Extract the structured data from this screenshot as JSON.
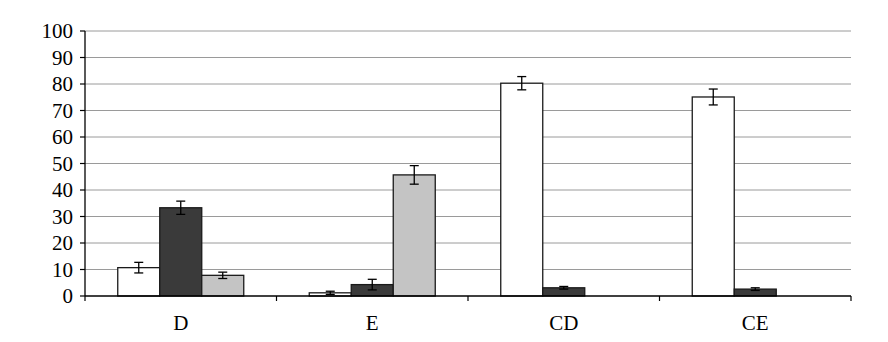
{
  "chart_data": {
    "type": "bar",
    "title": "",
    "xlabel": "",
    "ylabel": "",
    "ylim": [
      0,
      100
    ],
    "yticks": [
      0,
      10,
      20,
      30,
      40,
      50,
      60,
      70,
      80,
      90,
      100
    ],
    "grid": true,
    "legend": null,
    "categories": [
      "D",
      "E",
      "CD",
      "CE"
    ],
    "series": [
      {
        "name": "series-1",
        "fill": "#ffffff",
        "values": [
          10.7,
          1.2,
          80.3,
          75.1
        ],
        "errors": [
          2.0,
          0.6,
          2.5,
          3.0
        ]
      },
      {
        "name": "series-2",
        "fill": "#3a3a3a",
        "values": [
          33.3,
          4.3,
          3.1,
          2.6
        ],
        "errors": [
          2.5,
          2.0,
          0.5,
          0.5
        ]
      },
      {
        "name": "series-3",
        "fill": "#c4c4c4",
        "values": [
          7.8,
          45.7,
          0,
          0
        ],
        "errors": [
          1.2,
          3.5,
          0,
          0
        ]
      }
    ]
  },
  "colors": {
    "axis": "#000000",
    "grid": "#9a9a9a",
    "bar_stroke": "#1a1a1a"
  }
}
